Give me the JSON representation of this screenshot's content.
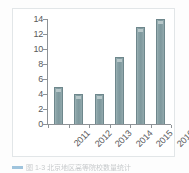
{
  "figure": {
    "panel_name": "bar-chart-figure",
    "caption_text": "图 1-3 北京地区高等院校数量统计"
  },
  "style": {
    "bar_fill": "#7e989d",
    "bar_edge": "#6e878c",
    "bar_highlight": "#b7c7c9",
    "axis_color": "#8d9296",
    "tick_text_color": "#58595b",
    "panel_border": "#e2e6e8",
    "panel_background": "#ffffff",
    "page_background": "#fdfdfd"
  },
  "chart_data": {
    "type": "bar",
    "title": "",
    "xlabel": "",
    "ylabel": "",
    "categories": [
      "2011",
      "2012",
      "2013",
      "2014",
      "2015",
      "2016"
    ],
    "values": [
      5,
      4,
      4,
      9,
      13,
      14
    ],
    "ylim": [
      0,
      14
    ],
    "ytick_values": [
      0,
      2,
      4,
      6,
      8,
      10,
      12,
      14
    ],
    "ytick_labels": [
      "0",
      "2",
      "4",
      "6",
      "8",
      "10",
      "12",
      "14"
    ],
    "grid": false,
    "legend": false,
    "xtick_rotation": -45,
    "series": [
      {
        "name": "数量",
        "values": [
          5,
          4,
          4,
          9,
          13,
          14
        ]
      }
    ]
  }
}
